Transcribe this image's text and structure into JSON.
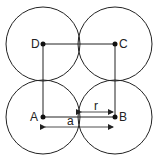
{
  "diagram": {
    "type": "square lattice of touching circles",
    "stroke_color": "#222222",
    "background": "#ffffff",
    "circles": [
      {
        "id": "circle-top-left",
        "cx": 43,
        "cy": 44,
        "r": 37
      },
      {
        "id": "circle-top-right",
        "cx": 115,
        "cy": 44,
        "r": 37
      },
      {
        "id": "circle-bottom-left",
        "cx": 43,
        "cy": 117,
        "r": 37
      },
      {
        "id": "circle-bottom-right",
        "cx": 115,
        "cy": 117,
        "r": 37
      }
    ],
    "points": {
      "A": {
        "label": "A",
        "x": 43,
        "y": 117
      },
      "B": {
        "label": "B",
        "x": 115,
        "y": 117
      },
      "C": {
        "label": "C",
        "x": 115,
        "y": 44
      },
      "D": {
        "label": "D",
        "x": 43,
        "y": 44
      }
    },
    "dimensions": {
      "radius": {
        "label": "r"
      },
      "lattice_constant": {
        "label": "a"
      }
    }
  }
}
